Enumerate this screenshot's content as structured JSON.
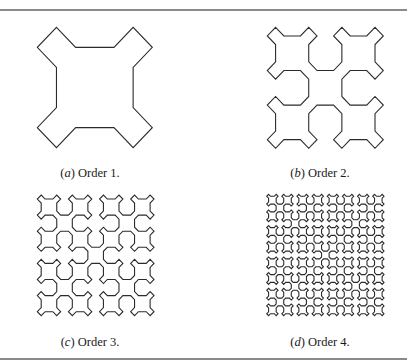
{
  "figure": {
    "rule_color": "#8a8a8a",
    "stroke_color": "#2b2b2b",
    "panels": [
      {
        "id": "a",
        "label": "a",
        "caption": "Order 1.",
        "order": 1,
        "bbox": {
          "x": 37.3,
          "y": 27.3,
          "w": 115.0,
          "h": 120.4
        },
        "caption_pos": {
          "cx": 90,
          "cy": 173
        }
      },
      {
        "id": "b",
        "label": "b",
        "caption": "Order 2.",
        "order": 2,
        "bbox": {
          "x": 267.3,
          "y": 27.3,
          "w": 116.0,
          "h": 121.0
        },
        "caption_pos": {
          "cx": 320,
          "cy": 173
        }
      },
      {
        "id": "c",
        "label": "c",
        "caption": "Order 3.",
        "order": 3,
        "bbox": {
          "x": 37.3,
          "y": 195.0,
          "w": 116.7,
          "h": 120.7
        },
        "caption_pos": {
          "cx": 90,
          "cy": 342
        }
      },
      {
        "id": "d",
        "label": "d",
        "caption": "Order 4.",
        "order": 4,
        "bbox": {
          "x": 266.7,
          "y": 194.3,
          "w": 117.3,
          "h": 121.4
        },
        "caption_pos": {
          "cx": 320,
          "cy": 342
        }
      }
    ]
  }
}
